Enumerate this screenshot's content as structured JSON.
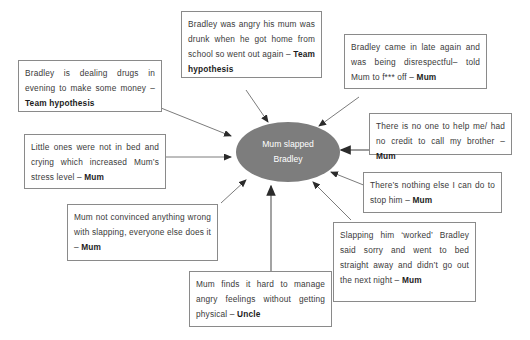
{
  "diagram": {
    "center_node": {
      "line1": "Mum slapped",
      "line2": "Bradley",
      "fill_color": "#7d7d7d",
      "text_color": "#ffffff"
    },
    "box_border_color": "#8a8a8a",
    "box_text_color": "#3a3a3a",
    "notes": [
      {
        "id": "note-drugs",
        "text": "Bradley is dealing drugs in evening to make some money – ",
        "source": "Team hypothesis"
      },
      {
        "id": "note-angry-drunk",
        "text": "Bradley was angry his mum was drunk when he got home from school so went out again – ",
        "source": "Team hypothesis"
      },
      {
        "id": "note-late-disrespectful",
        "text": "Bradley came in late again and was being disrespectful– told Mum to f*** off – ",
        "source": "Mum"
      },
      {
        "id": "note-no-one-to-help",
        "text": "There is no one to help me/ had no credit to call my brother – ",
        "source": "Mum"
      },
      {
        "id": "note-little-ones",
        "text": "Little ones were not in bed and crying which increased Mum’s stress level – ",
        "source": "Mum"
      },
      {
        "id": "note-nothing-else",
        "text": "There’s nothing else I can do to stop him – ",
        "source": "Mum"
      },
      {
        "id": "note-not-convinced",
        "text": "Mum not convinced anything wrong with slapping, everyone else does it – ",
        "source": "Mum"
      },
      {
        "id": "note-slapping-worked",
        "text": "Slapping him ‘worked’ Bradley said sorry and went to bed straight away and didn’t go out the next night – ",
        "source": "Mum"
      },
      {
        "id": "note-manage-anger",
        "text": "Mum finds it hard to manage angry feelings without getting physical – ",
        "source": "Uncle"
      }
    ]
  }
}
